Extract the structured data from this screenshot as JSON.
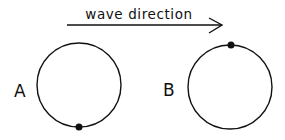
{
  "diagram": {
    "arrow": {
      "label": "wave direction",
      "x1": 67,
      "y1": 25,
      "x2": 222,
      "y2": 25
    },
    "circles": [
      {
        "label": "A",
        "cx": 79,
        "cy": 85,
        "r": 42,
        "dot": {
          "position": "bottom",
          "cx": 79,
          "cy": 127
        }
      },
      {
        "label": "B",
        "cx": 230,
        "cy": 87,
        "r": 42,
        "dot": {
          "position": "top",
          "cx": 231,
          "cy": 45
        }
      }
    ],
    "colors": {
      "stroke": "#111111",
      "background": "#ffffff"
    }
  }
}
